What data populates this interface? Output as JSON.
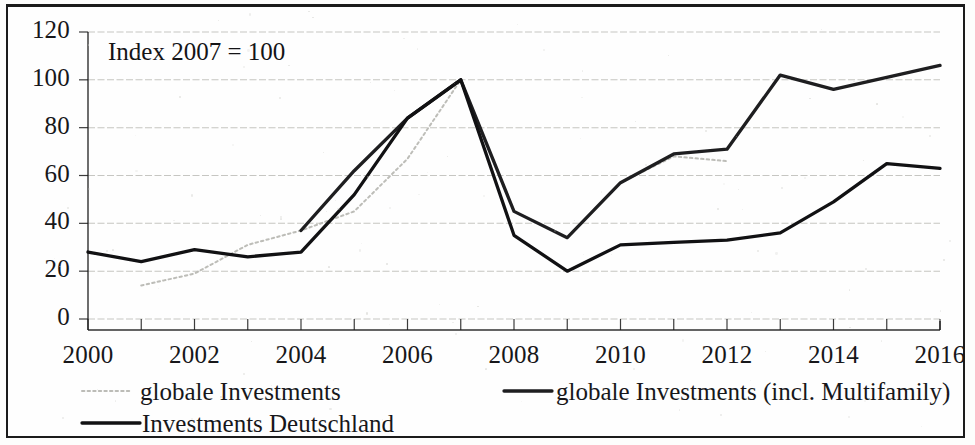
{
  "chart_data": {
    "type": "line",
    "title": "",
    "annotation": "Index 2007 = 100",
    "xlabel": "",
    "ylabel": "",
    "xlim": [
      2000,
      2016
    ],
    "ylim": [
      0,
      120
    ],
    "ytick_step": 20,
    "xtick_step": 1,
    "xtick_label_step": 2,
    "grid": true,
    "grid_axis": "y",
    "legend_position": "bottom",
    "x": [
      2000,
      2001,
      2002,
      2003,
      2004,
      2005,
      2006,
      2007,
      2008,
      2009,
      2010,
      2011,
      2012,
      2013,
      2014,
      2015,
      2016
    ],
    "ytick_labels": [
      "0",
      "20",
      "40",
      "60",
      "80",
      "100",
      "120"
    ],
    "ytick_values": [
      0,
      20,
      40,
      60,
      80,
      100,
      120
    ],
    "xtick_labels": [
      "2000",
      "2002",
      "2004",
      "2006",
      "2008",
      "2010",
      "2012",
      "2014",
      "2016"
    ],
    "xtick_label_values": [
      2000,
      2002,
      2004,
      2006,
      2008,
      2010,
      2012,
      2014,
      2016
    ],
    "series": [
      {
        "name": "globale Investments",
        "style": "dotted-light",
        "color": "#b9b9b4",
        "x": [
          2001,
          2002,
          2003,
          2004,
          2005,
          2006,
          2007,
          2008,
          2009,
          2010,
          2011,
          2012
        ],
        "values": [
          14,
          19,
          31,
          37,
          45,
          67,
          100,
          45,
          34,
          57,
          68,
          66
        ]
      },
      {
        "name": "globale Investments (incl. Multifamily)",
        "style": "solid-dark",
        "color": "#1e1e20",
        "x": [
          2004,
          2005,
          2006,
          2007,
          2008,
          2009,
          2010,
          2011,
          2012,
          2013,
          2014,
          2015,
          2016
        ],
        "values": [
          37,
          62,
          84,
          100,
          45,
          34,
          57,
          69,
          71,
          102,
          96,
          101,
          106
        ]
      },
      {
        "name": "Investments Deutschland",
        "style": "solid-black",
        "color": "#111113",
        "x": [
          2000,
          2001,
          2002,
          2003,
          2004,
          2005,
          2006,
          2007,
          2008,
          2009,
          2010,
          2011,
          2012,
          2013,
          2014,
          2015,
          2016
        ],
        "values": [
          28,
          24,
          29,
          26,
          28,
          52,
          84,
          100,
          35,
          20,
          31,
          32,
          33,
          36,
          49,
          65,
          63
        ]
      }
    ]
  },
  "legend": {
    "items": [
      {
        "label": "globale Investments",
        "marker": "dotted-light"
      },
      {
        "label": "globale Investments (incl. Multifamily)",
        "marker": "solid-dark"
      },
      {
        "label": "Investments Deutschland",
        "marker": "solid-black"
      }
    ]
  },
  "colors": {
    "axis": "#1b1b1b",
    "grid": "#bdbdb8",
    "text": "#17171a",
    "series_light": "#b9b9b4",
    "series_dark": "#1e1e20",
    "series_black": "#111113",
    "frame": "#1b1b1b",
    "background": "#fefefe"
  }
}
